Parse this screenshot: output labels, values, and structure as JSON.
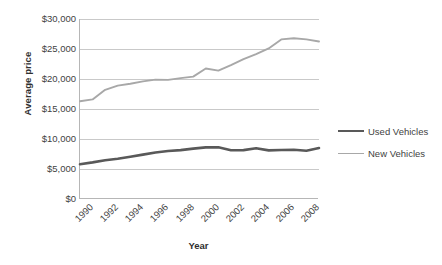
{
  "chart_data": {
    "type": "line",
    "title": "",
    "xlabel": "Year",
    "ylabel": "Average price",
    "x": [
      1990,
      1991,
      1992,
      1993,
      1994,
      1995,
      1996,
      1997,
      1998,
      1999,
      2000,
      2001,
      2002,
      2003,
      2004,
      2005,
      2006,
      2007,
      2008,
      2009
    ],
    "xtick_labels": [
      "1990",
      "1992",
      "1994",
      "1996",
      "1998",
      "2000",
      "2002",
      "2004",
      "2006",
      "2008"
    ],
    "ytick_labels": [
      "$0",
      "$5,000",
      "$10,000",
      "$15,000",
      "$20,000",
      "$25,000",
      "$30,000"
    ],
    "ytick_values": [
      0,
      5000,
      10000,
      15000,
      20000,
      25000,
      30000
    ],
    "ylim": [
      0,
      30000
    ],
    "xlim": [
      1990,
      2009
    ],
    "grid": true,
    "legend_position": "right",
    "series": [
      {
        "name": "Used Vehicles",
        "color": "#595959",
        "line_width": 2.6,
        "values": [
          5800,
          6100,
          6450,
          6700,
          7050,
          7400,
          7750,
          8000,
          8150,
          8400,
          8600,
          8620,
          8120,
          8150,
          8450,
          8100,
          8170,
          8200,
          8050,
          8500
        ]
      },
      {
        "name": "New Vehicles",
        "color": "#a8a8a8",
        "line_width": 1.9,
        "values": [
          16300,
          16600,
          18200,
          18900,
          19200,
          19600,
          19900,
          19850,
          20150,
          20400,
          21750,
          21400,
          22300,
          23300,
          24150,
          25100,
          26600,
          26800,
          26600,
          26250
        ]
      }
    ]
  },
  "legend": {
    "items": [
      {
        "label": "Used Vehicles"
      },
      {
        "label": "New Vehicles"
      }
    ]
  }
}
